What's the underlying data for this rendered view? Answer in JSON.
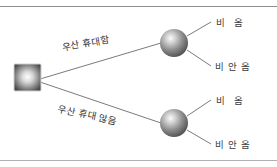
{
  "diagram": {
    "type": "decision-tree",
    "clipped_header": "",
    "decision_node": {
      "shape": "square",
      "label": ""
    },
    "branches": [
      {
        "id": "carry",
        "label": "우산 휴대함"
      },
      {
        "id": "not-carry",
        "label": "우산 휴대 않음"
      }
    ],
    "chance_nodes": [
      {
        "id": "chance-upper",
        "shape": "circle",
        "outcomes": [
          {
            "id": "rain-1",
            "label": "비 옴"
          },
          {
            "id": "no-rain-1",
            "label": "비 안 옴"
          }
        ]
      },
      {
        "id": "chance-lower",
        "shape": "circle",
        "outcomes": [
          {
            "id": "rain-2",
            "label": "비 옴"
          },
          {
            "id": "no-rain-2",
            "label": "비 안 옴"
          }
        ]
      }
    ],
    "colors": {
      "line": "#6b6b6b",
      "rule": "#9a9a9a",
      "text": "#3a3a3a",
      "node_dark": "#4a4a4a",
      "node_light": "#f2f2f2"
    }
  }
}
